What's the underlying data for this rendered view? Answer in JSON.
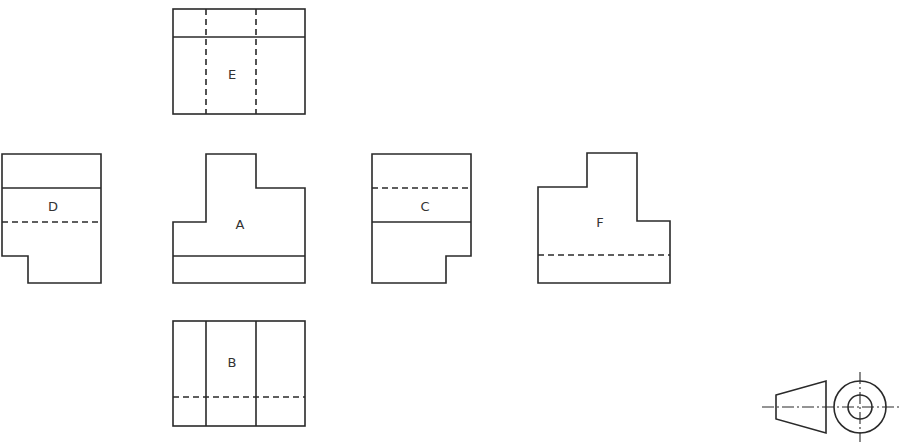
{
  "drawing": {
    "type": "orthographic-projection-views",
    "line_color": "#2a2a2a",
    "background": "#ffffff"
  },
  "views": [
    {
      "id": "E",
      "label": "E",
      "position": "top",
      "label_xy": [
        232,
        74
      ]
    },
    {
      "id": "D",
      "label": "D",
      "position": "left",
      "label_xy": [
        53,
        206
      ]
    },
    {
      "id": "A",
      "label": "A",
      "position": "front",
      "label_xy": [
        240,
        224
      ]
    },
    {
      "id": "C",
      "label": "C",
      "position": "right",
      "label_xy": [
        425,
        206
      ]
    },
    {
      "id": "F",
      "label": "F",
      "position": "rear",
      "label_xy": [
        600,
        222
      ]
    },
    {
      "id": "B",
      "label": "B",
      "position": "bottom",
      "label_xy": [
        232,
        362
      ]
    }
  ],
  "projection_symbol": {
    "name": "projection-method-symbol",
    "shape": "truncated-cone-with-concentric-circles"
  }
}
